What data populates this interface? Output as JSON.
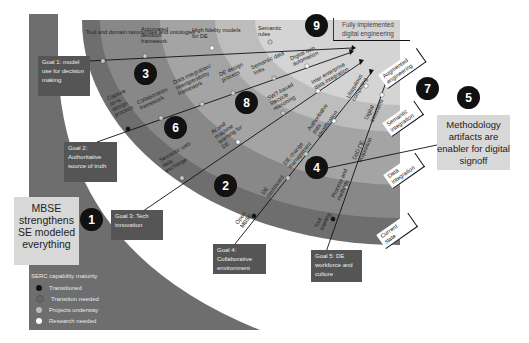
{
  "colors": {
    "band_outer": "#6e6e6e",
    "band_dark": "#888888",
    "band_mid": "#a4a4a4",
    "band_light": "#bdbdbd",
    "band_lightest": "#d4d4d4",
    "goal_box": "#555555",
    "callout": "#d8d8d8",
    "badge": "#111111"
  },
  "stages": [
    {
      "label": "Current state"
    },
    {
      "label": "Data integration"
    },
    {
      "label": "Semantic integration"
    },
    {
      "label": "Augmented engineering"
    }
  ],
  "endpoint": {
    "label": "Fully implemented digital engineering"
  },
  "goals": [
    {
      "label": "Goal 1: model use for decision making"
    },
    {
      "label": "Goal 2: Authoritative source of truth"
    },
    {
      "label": "Goal 3: Tech innovation"
    },
    {
      "label": "Goal 4: Collaborative environment"
    },
    {
      "label": "Goal 5: DE workforce and culture"
    }
  ],
  "badges": [
    "1",
    "2",
    "3",
    "4",
    "5",
    "6",
    "7",
    "8",
    "9"
  ],
  "callouts": {
    "mbse": "MBSE strengthens SE modeled everything",
    "methodology": "Methodology artifacts are enabler for digital signoff"
  },
  "capabilities": [
    {
      "label": "Tool and domain taxonomies and ontologies",
      "goal": 1
    },
    {
      "label": "Automated decision framework",
      "goal": 1
    },
    {
      "label": "High fidelity models for DE",
      "goal": 1
    },
    {
      "label": "Semantic rules",
      "goal": 1
    },
    {
      "label": "Capture as-is design process",
      "goal": 2
    },
    {
      "label": "Collaboration framework",
      "goal": 2
    },
    {
      "label": "Data integration/ interoperability framework",
      "goal": 2
    },
    {
      "label": "DE design process",
      "goal": 2
    },
    {
      "label": "Semantic data links",
      "goal": 2
    },
    {
      "label": "Digital twin automation",
      "goal": 2
    },
    {
      "label": "Semantic web data exchange",
      "goal": 3
    },
    {
      "label": "AI and machine learning for DE",
      "goal": 3
    },
    {
      "label": "SWT-based lifecycle reasoning",
      "goal": 3
    },
    {
      "label": "Inter-enterprise data integration",
      "goal": 3
    },
    {
      "label": "Open MBSE",
      "goal": 4
    },
    {
      "label": "DE dashboard",
      "goal": 4
    },
    {
      "label": "DE change management",
      "goal": 4
    },
    {
      "label": "Authoritative data identification",
      "goal": 4
    },
    {
      "label": "Ubiquitous computing",
      "goal": 4
    },
    {
      "label": "Tool training",
      "goal": 5
    },
    {
      "label": "Process and methods",
      "goal": 5
    },
    {
      "label": "DoD DE acquisition",
      "goal": 5
    },
    {
      "label": "Digital assistants",
      "goal": 5
    }
  ],
  "legend": {
    "title": "SERC capability maturity",
    "items": [
      {
        "label": "Transitioned",
        "color": "#111111"
      },
      {
        "label": "Transition needed",
        "color": "#666666"
      },
      {
        "label": "Projects underway",
        "color": "#bbbbbb"
      },
      {
        "label": "Research needed",
        "color": "#ffffff"
      }
    ]
  }
}
